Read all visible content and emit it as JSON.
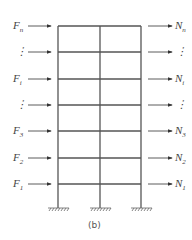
{
  "diagram": {
    "caption": "(b)",
    "left_forces": [
      {
        "base": "F",
        "sub": "n"
      },
      {
        "base": "⋮",
        "sub": ""
      },
      {
        "base": "F",
        "sub": "i"
      },
      {
        "base": "⋮",
        "sub": ""
      },
      {
        "base": "F",
        "sub": "3"
      },
      {
        "base": "F",
        "sub": "2"
      },
      {
        "base": "F",
        "sub": "1"
      }
    ],
    "right_forces": [
      {
        "base": "N",
        "sub": "n"
      },
      {
        "base": "⋮",
        "sub": ""
      },
      {
        "base": "N",
        "sub": "i"
      },
      {
        "base": "⋮",
        "sub": ""
      },
      {
        "base": "N",
        "sub": "3"
      },
      {
        "base": "N",
        "sub": "2"
      },
      {
        "base": "N",
        "sub": "1"
      }
    ],
    "floor_y": [
      26,
      52,
      79,
      105,
      131,
      158,
      184
    ],
    "columns_x": [
      58,
      100,
      141
    ],
    "ground_y": 208,
    "line_color": "#555555"
  }
}
